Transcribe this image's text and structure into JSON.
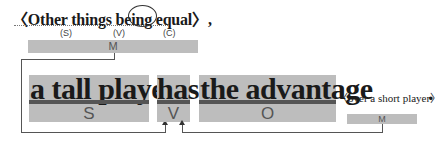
{
  "top_phrase": {
    "open_bracket": "〈",
    "text": "Other things being equal",
    "close_bracket": "〉",
    "trailing": ",",
    "roles": {
      "s": "(S)",
      "v": "(V)",
      "c": "(C)"
    },
    "bar_label": "M"
  },
  "main_sentence": {
    "subject": {
      "text": "a tall player",
      "role": "S"
    },
    "verb": {
      "text": "has",
      "role": "V"
    },
    "object": {
      "text": "the advantage",
      "role": "O"
    },
    "modifier": {
      "text": "〈over a short player〉",
      "role": "M"
    },
    "period": "."
  },
  "colors": {
    "bar": "#bdbdbd",
    "underline": "#555555",
    "text": "#1a1a1a"
  }
}
